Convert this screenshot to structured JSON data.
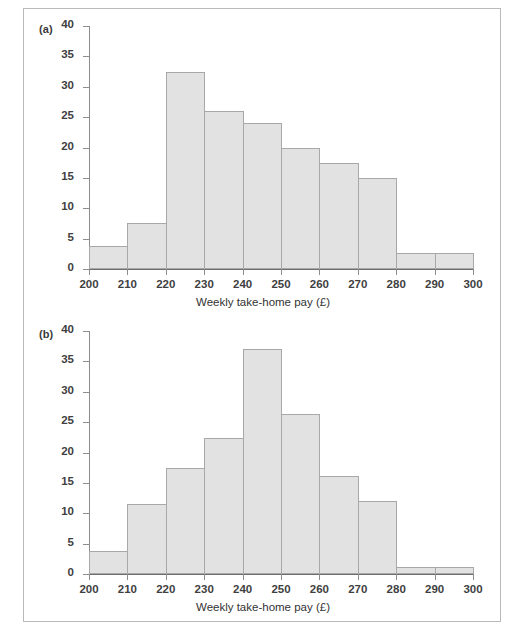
{
  "figure": {
    "panels": [
      {
        "key": "a",
        "label": "(a)",
        "xlabel": "Weekly take-home pay (£)"
      },
      {
        "key": "b",
        "label": "(b)",
        "xlabel": "Weekly take-home pay (£)"
      }
    ],
    "yticks": [
      "0",
      "5",
      "10",
      "15",
      "20",
      "25",
      "30",
      "35",
      "40"
    ],
    "xticks": [
      "200",
      "210",
      "220",
      "230",
      "240",
      "250",
      "260",
      "270",
      "280",
      "290",
      "300"
    ],
    "colors": {
      "bar_fill": "#e2e2e2",
      "bar_stroke": "#a8a8a8",
      "axis": "#8d8d8d",
      "text": "#3f3f3f",
      "frame": "#b9b9b9"
    }
  },
  "chart_data": [
    {
      "type": "bar",
      "title": "(a)",
      "subtitle": "",
      "xlabel": "Weekly take-home pay (£)",
      "ylabel": "",
      "bin_edges": [
        200,
        210,
        220,
        230,
        240,
        250,
        260,
        270,
        280,
        290,
        300
      ],
      "categories": [
        "200-210",
        "210-220",
        "220-230",
        "230-240",
        "240-250",
        "250-260",
        "260-270",
        "270-280",
        "280-290",
        "290-300"
      ],
      "values": [
        3.8,
        7.6,
        32.5,
        26.0,
        24.0,
        20.0,
        17.5,
        15.0,
        2.7,
        2.7
      ],
      "xlim": [
        200,
        300
      ],
      "ylim": [
        0,
        40
      ],
      "ytick_values": [
        0,
        5,
        10,
        15,
        20,
        25,
        30,
        35,
        40
      ],
      "xtick_values": [
        200,
        210,
        220,
        230,
        240,
        250,
        260,
        270,
        280,
        290,
        300
      ],
      "grid": false,
      "legend": false
    },
    {
      "type": "bar",
      "title": "(b)",
      "subtitle": "",
      "xlabel": "Weekly take-home pay (£)",
      "ylabel": "",
      "bin_edges": [
        200,
        210,
        220,
        230,
        240,
        250,
        260,
        270,
        280,
        290,
        300
      ],
      "categories": [
        "200-210",
        "210-220",
        "220-230",
        "230-240",
        "240-250",
        "250-260",
        "260-270",
        "270-280",
        "280-290",
        "290-300"
      ],
      "values": [
        3.8,
        11.6,
        17.4,
        22.4,
        37.1,
        26.4,
        16.2,
        12.0,
        1.2,
        1.2
      ],
      "xlim": [
        200,
        300
      ],
      "ylim": [
        0,
        40
      ],
      "ytick_values": [
        0,
        5,
        10,
        15,
        20,
        25,
        30,
        35,
        40
      ],
      "xtick_values": [
        200,
        210,
        220,
        230,
        240,
        250,
        260,
        270,
        280,
        290,
        300
      ],
      "grid": false,
      "legend": false
    }
  ]
}
